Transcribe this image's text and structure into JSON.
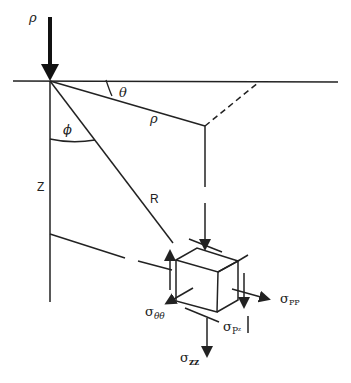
{
  "diagram": {
    "title": "",
    "labels": {
      "load": "ρ",
      "theta": "θ",
      "rho": "ρ",
      "phi": "ϕ",
      "z": "Z",
      "R": "R",
      "sigma_pp": "σ",
      "sigma_pp_sub": "PP",
      "sigma_thetatheta": "σ",
      "sigma_thetatheta_sub": "θθ",
      "sigma_pz": "σ",
      "sigma_pz_sub": "Pᶻ",
      "sigma_zz": "σ",
      "sigma_zz_sub": "zz"
    },
    "colors": {
      "line": "#222222",
      "background": "#ffffff"
    }
  }
}
